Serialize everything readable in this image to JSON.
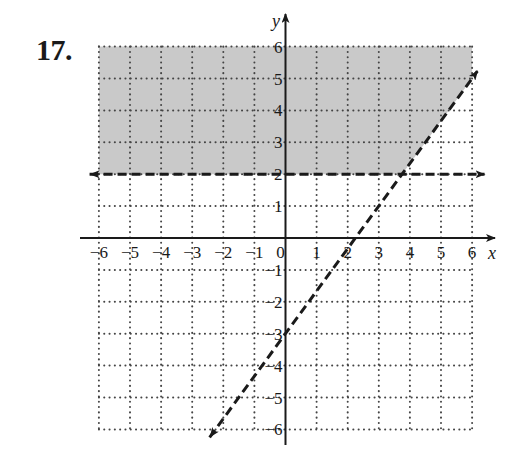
{
  "problem": {
    "number": "17."
  },
  "chart_data": {
    "type": "line",
    "title": "",
    "xlabel": "x",
    "ylabel": "y",
    "xlim": [
      -6,
      6
    ],
    "ylim": [
      -6,
      6
    ],
    "grid": true,
    "grid_style": "dotted",
    "x_ticks": [
      -6,
      -5,
      -4,
      -3,
      -2,
      -1,
      0,
      1,
      2,
      3,
      4,
      5,
      6
    ],
    "y_ticks": [
      -6,
      -5,
      -4,
      -3,
      -2,
      -1,
      1,
      2,
      3,
      4,
      5,
      6
    ],
    "x_tick_labels": [
      "−6",
      "−5",
      "−4",
      "−3",
      "−2",
      "−1",
      "0",
      "1",
      "2",
      "3",
      "4",
      "5",
      "6"
    ],
    "y_tick_labels": [
      "−6",
      "−5",
      "−4",
      "−3",
      "−2",
      "−1",
      "1",
      "2",
      "3",
      "4",
      "5",
      "6"
    ],
    "series": [
      {
        "name": "boundary y = 2",
        "style": "dashed",
        "arrows": "both",
        "points": [
          [
            -6.3,
            2
          ],
          [
            6.4,
            2
          ]
        ]
      },
      {
        "name": "boundary y = (4/3)x − 3",
        "style": "dashed",
        "arrows": "both",
        "points": [
          [
            -2.44,
            -6.25
          ],
          [
            6.17,
            5.23
          ]
        ]
      }
    ],
    "shaded_region": {
      "description": "y > 2 and y > (4/3)x − 3",
      "polygon": [
        [
          -6,
          2
        ],
        [
          3.75,
          2
        ],
        [
          6,
          5
        ],
        [
          6,
          6
        ],
        [
          -6,
          6
        ]
      ],
      "color": "#c9c9c9"
    }
  },
  "colors": {
    "ink": "#1a1a1a",
    "grid_dot": "#444444",
    "shade": "#c9c9c9"
  }
}
